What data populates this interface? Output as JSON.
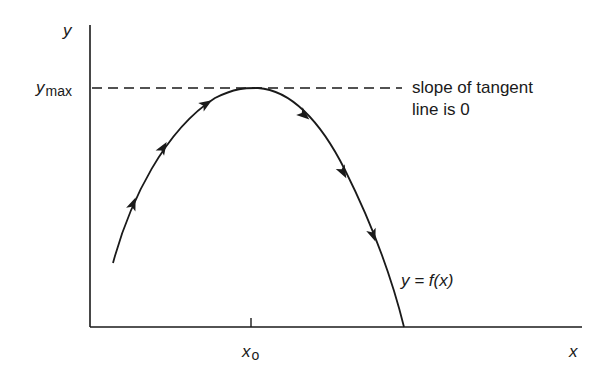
{
  "diagram": {
    "type": "function-maximum",
    "axes": {
      "y_label": "y",
      "x_label": "x"
    },
    "y_max_label": {
      "base": "y",
      "subscript": "max"
    },
    "x0_label": {
      "base": "x",
      "subscript": "o"
    },
    "annotation": {
      "line1": "slope of tangent",
      "line2": "line is 0"
    },
    "curve_label": "y = f(x)",
    "curve_arrows_rising": 3,
    "curve_arrows_falling": 3,
    "colors": {
      "stroke": "#1a1a1a",
      "background": "#ffffff"
    }
  }
}
